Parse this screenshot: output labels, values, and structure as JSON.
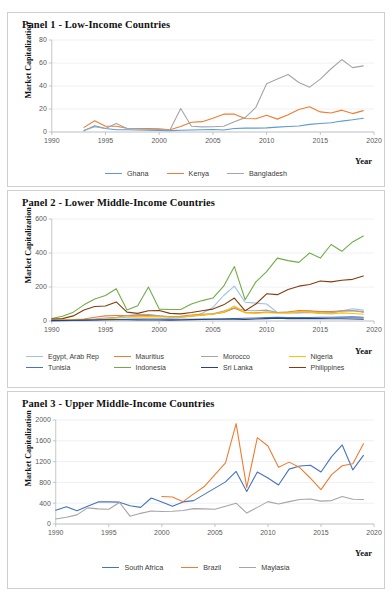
{
  "figure": {
    "ylabel": "Market Capitalization",
    "xlabel": "Year"
  },
  "panels": [
    {
      "id": "panel-1",
      "title": "Panel 1 - Low-Income Countries",
      "ylabel": "Market Capitalization",
      "xlabel": "Year",
      "yticks": [
        "0",
        "20",
        "40",
        "60",
        "80"
      ],
      "xticks": [
        "1990",
        "1995",
        "2000",
        "2005",
        "2010",
        "2015",
        "2020"
      ],
      "legend": [
        "Ghana",
        "Kenya",
        "Bangladesh"
      ]
    },
    {
      "id": "panel-2",
      "title": "Panel 2 - Lower Middle-Income Countries",
      "ylabel": "Market Capitalization",
      "xlabel": "Year",
      "yticks": [
        "0",
        "200",
        "400",
        "600"
      ],
      "xticks": [
        "1990",
        "1995",
        "2000",
        "2005",
        "2010",
        "2015",
        "2020"
      ],
      "legend": [
        "Egypt, Arab Rep",
        "Mauritius",
        "Morocco",
        "Nigeria",
        "Tunisia",
        "Indonesia",
        "Sri Lanka",
        "Philippines"
      ]
    },
    {
      "id": "panel-3",
      "title": "Panel 3 - Upper Middle-Income Countries",
      "ylabel": "Market Capitalization",
      "xlabel": "Year",
      "yticks": [
        "0",
        "400",
        "800",
        "1200",
        "1600",
        "2000"
      ],
      "xticks": [
        "1990",
        "1995",
        "2000",
        "2005",
        "2010",
        "2015",
        "2020"
      ],
      "legend": [
        "South Africa",
        "Brazil",
        "Maylasia"
      ]
    }
  ],
  "chart_data": [
    {
      "type": "line",
      "title": "Panel 1 - Low-Income Countries",
      "xlabel": "Year",
      "ylabel": "Market Capitalization",
      "xlim": [
        1990,
        2020
      ],
      "ylim": [
        0,
        80
      ],
      "yticks": [
        0,
        20,
        40,
        60,
        80
      ],
      "xticks": [
        1990,
        1995,
        2000,
        2005,
        2010,
        2015,
        2020
      ],
      "grid": true,
      "legend_position": "bottom",
      "series": [
        {
          "name": "Ghana",
          "color": "#5B9BD5",
          "x": [
            1993,
            1994,
            1995,
            1996,
            1997,
            1998,
            1999,
            2000,
            2001,
            2002,
            2003,
            2004,
            2005,
            2006,
            2007,
            2008,
            2009,
            2010,
            2011,
            2012,
            2013,
            2014,
            2015,
            2016,
            2017,
            2018,
            2019
          ],
          "values": [
            1.0,
            5.5,
            3.0,
            2.0,
            2.0,
            1.8,
            1.6,
            1.4,
            1.2,
            1.5,
            1.7,
            2.0,
            2.2,
            1.8,
            3.0,
            3.4,
            3.4,
            3.6,
            4.2,
            4.8,
            5.2,
            6.6,
            7.4,
            8.0,
            9.5,
            10.6,
            12.0
          ]
        },
        {
          "name": "Kenya",
          "color": "#ED7D31",
          "x": [
            1993,
            1994,
            1995,
            1996,
            1997,
            1998,
            1999,
            2000,
            2001,
            2002,
            2003,
            2004,
            2005,
            2006,
            2007,
            2008,
            2009,
            2010,
            2011,
            2012,
            2013,
            2014,
            2015,
            2016,
            2017,
            2018,
            2019
          ],
          "values": [
            4.0,
            9.8,
            5.0,
            5.0,
            3.2,
            3.0,
            3.0,
            2.8,
            1.9,
            4.8,
            8.5,
            9.0,
            12.0,
            15.5,
            15.5,
            11.8,
            11.5,
            14.5,
            11.2,
            15.0,
            19.5,
            22.0,
            17.5,
            16.5,
            19.0,
            16.0,
            18.6
          ]
        },
        {
          "name": "Bangladesh",
          "color": "#A5A5A5",
          "x": [
            1993,
            1994,
            1995,
            1996,
            1997,
            1998,
            1999,
            2000,
            2001,
            2002,
            2003,
            2004,
            2005,
            2006,
            2007,
            2008,
            2009,
            2010,
            2011,
            2012,
            2013,
            2014,
            2015,
            2016,
            2017,
            2018,
            2019
          ],
          "values": [
            1.5,
            4.5,
            3.0,
            7.5,
            3.0,
            2.6,
            2.4,
            2.2,
            1.8,
            20.5,
            5.0,
            4.5,
            4.6,
            5.0,
            9.0,
            12.5,
            21.5,
            42.0,
            46.0,
            50.0,
            43.0,
            39.0,
            46.0,
            55.0,
            63.0,
            56.0,
            57.5
          ]
        }
      ]
    },
    {
      "type": "line",
      "title": "Panel 2 - Lower Middle-Income Countries",
      "xlabel": "Year",
      "ylabel": "Market Capitalization",
      "xlim": [
        1990,
        2020
      ],
      "ylim": [
        0,
        600
      ],
      "yticks": [
        0,
        200,
        400,
        600
      ],
      "xticks": [
        1990,
        1995,
        2000,
        2005,
        2010,
        2015,
        2020
      ],
      "grid": true,
      "legend_position": "bottom",
      "series": [
        {
          "name": "Egypt, Arab Rep",
          "color": "#9DC3E6",
          "x": [
            1990,
            1991,
            1992,
            1993,
            1994,
            1995,
            1996,
            1997,
            1998,
            1999,
            2000,
            2001,
            2002,
            2003,
            2004,
            2005,
            2006,
            2007,
            2008,
            2009,
            2010,
            2011,
            2012,
            2013,
            2014,
            2015,
            2016,
            2017,
            2018,
            2019
          ],
          "values": [
            6,
            6,
            7,
            8,
            10,
            12,
            20,
            25,
            28,
            35,
            30,
            25,
            22,
            28,
            45,
            80,
            150,
            205,
            110,
            105,
            100,
            50,
            52,
            55,
            58,
            48,
            46,
            60,
            72,
            64
          ]
        },
        {
          "name": "Mauritius",
          "color": "#ED7D31",
          "x": [
            1990,
            1991,
            1992,
            1993,
            1994,
            1995,
            1996,
            1997,
            1998,
            1999,
            2000,
            2001,
            2002,
            2003,
            2004,
            2005,
            2006,
            2007,
            2008,
            2009,
            2010,
            2011,
            2012,
            2013,
            2014,
            2015,
            2016,
            2017,
            2018,
            2019
          ],
          "values": [
            5,
            6,
            8,
            12,
            22,
            30,
            32,
            32,
            30,
            32,
            28,
            26,
            28,
            35,
            40,
            42,
            50,
            75,
            50,
            48,
            52,
            50,
            52,
            62,
            60,
            55,
            55,
            60,
            62,
            52
          ]
        },
        {
          "name": "Morocco",
          "color": "#A5A5A5",
          "x": [
            1990,
            1991,
            1992,
            1993,
            1994,
            1995,
            1996,
            1997,
            1998,
            1999,
            2000,
            2001,
            2002,
            2003,
            2004,
            2005,
            2006,
            2007,
            2008,
            2009,
            2010,
            2011,
            2012,
            2013,
            2014,
            2015,
            2016,
            2017,
            2018,
            2019
          ],
          "values": [
            4,
            4,
            5,
            8,
            12,
            18,
            22,
            32,
            38,
            38,
            30,
            25,
            24,
            28,
            34,
            42,
            58,
            78,
            62,
            60,
            64,
            50,
            48,
            48,
            50,
            46,
            50,
            58,
            60,
            55
          ]
        },
        {
          "name": "Nigeria",
          "color": "#FFC000",
          "x": [
            1990,
            1991,
            1992,
            1993,
            1994,
            1995,
            1996,
            1997,
            1998,
            1999,
            2000,
            2001,
            2002,
            2003,
            2004,
            2005,
            2006,
            2007,
            2008,
            2009,
            2010,
            2011,
            2012,
            2013,
            2014,
            2015,
            2016,
            2017,
            2018,
            2019
          ],
          "values": [
            3,
            4,
            5,
            7,
            9,
            12,
            18,
            22,
            24,
            26,
            24,
            22,
            22,
            30,
            36,
            40,
            52,
            88,
            48,
            46,
            50,
            46,
            48,
            56,
            52,
            45,
            42,
            48,
            44,
            40
          ]
        },
        {
          "name": "Tunisia",
          "color": "#4472C4",
          "x": [
            1990,
            1991,
            1992,
            1993,
            1994,
            1995,
            1996,
            1997,
            1998,
            1999,
            2000,
            2001,
            2002,
            2003,
            2004,
            2005,
            2006,
            2007,
            2008,
            2009,
            2010,
            2011,
            2012,
            2013,
            2014,
            2015,
            2016,
            2017,
            2018,
            2019
          ],
          "values": [
            2,
            2,
            3,
            4,
            6,
            7,
            9,
            10,
            11,
            12,
            12,
            11,
            10,
            10,
            11,
            12,
            13,
            15,
            16,
            18,
            20,
            22,
            20,
            20,
            21,
            22,
            22,
            23,
            24,
            22
          ]
        },
        {
          "name": "Indonesia",
          "color": "#70AD47",
          "x": [
            1990,
            1991,
            1992,
            1993,
            1994,
            1995,
            1996,
            1997,
            1998,
            1999,
            2000,
            2001,
            2002,
            2003,
            2004,
            2005,
            2006,
            2007,
            2008,
            2009,
            2010,
            2011,
            2012,
            2013,
            2014,
            2015,
            2016,
            2017,
            2018,
            2019
          ],
          "values": [
            15,
            28,
            52,
            95,
            130,
            150,
            190,
            65,
            90,
            200,
            70,
            68,
            68,
            100,
            120,
            135,
            205,
            320,
            125,
            230,
            290,
            370,
            355,
            345,
            400,
            370,
            450,
            410,
            465,
            500,
            565,
            545,
            570
          ]
        },
        {
          "name": "Sri Lanka",
          "color": "#264478",
          "x": [
            1990,
            1991,
            1992,
            1993,
            1994,
            1995,
            1996,
            1997,
            1998,
            1999,
            2000,
            2001,
            2002,
            2003,
            2004,
            2005,
            2006,
            2007,
            2008,
            2009,
            2010,
            2011,
            2012,
            2013,
            2014,
            2015,
            2016,
            2017,
            2018,
            2019
          ],
          "values": [
            2,
            3,
            4,
            5,
            6,
            7,
            7,
            7,
            6,
            6,
            6,
            5,
            6,
            8,
            9,
            10,
            10,
            11,
            9,
            12,
            14,
            16,
            14,
            14,
            15,
            14,
            13,
            13,
            12,
            11
          ]
        },
        {
          "name": "Philippines",
          "color": "#843C0C",
          "x": [
            1990,
            1991,
            1992,
            1993,
            1994,
            1995,
            1996,
            1997,
            1998,
            1999,
            2000,
            2001,
            2002,
            2003,
            2004,
            2005,
            2006,
            2007,
            2008,
            2009,
            2010,
            2011,
            2012,
            2013,
            2014,
            2015,
            2016,
            2017,
            2018,
            2019
          ],
          "values": [
            12,
            14,
            30,
            65,
            85,
            88,
            112,
            52,
            45,
            60,
            62,
            45,
            42,
            50,
            60,
            70,
            95,
            135,
            60,
            100,
            160,
            155,
            185,
            205,
            215,
            235,
            230,
            240,
            245,
            265,
            290,
            275,
            270
          ]
        }
      ]
    },
    {
      "type": "line",
      "title": "Panel 3 - Upper Middle-Income Countries",
      "xlabel": "Year",
      "ylabel": "Market Capitalization",
      "xlim": [
        1990,
        2020
      ],
      "ylim": [
        0,
        2000
      ],
      "yticks": [
        0,
        400,
        800,
        1200,
        1600,
        2000
      ],
      "xticks": [
        1990,
        1995,
        2000,
        2005,
        2010,
        2015,
        2020
      ],
      "grid": true,
      "legend_position": "bottom",
      "series": [
        {
          "name": "South Africa",
          "color": "#4472C4",
          "x": [
            1990,
            1991,
            1992,
            1993,
            1994,
            1995,
            1996,
            1997,
            1998,
            1999,
            2000,
            2001,
            2002,
            2003,
            2004,
            2005,
            2006,
            2007,
            2008,
            2009,
            2010,
            2011,
            2012,
            2013,
            2014,
            2015,
            2016,
            2017,
            2018,
            2019
          ],
          "values": [
            265,
            330,
            255,
            340,
            425,
            425,
            420,
            350,
            320,
            500,
            425,
            340,
            425,
            450,
            570,
            690,
            810,
            1010,
            625,
            1000,
            885,
            750,
            1055,
            1115,
            1130,
            1000,
            1295,
            1520,
            1040,
            1320
          ]
        },
        {
          "name": "Brazil",
          "color": "#ED7D31",
          "x": [
            2000,
            2001,
            2002,
            2003,
            2004,
            2005,
            2006,
            2007,
            2008,
            2009,
            2010,
            2011,
            2012,
            2013,
            2014,
            2015,
            2016,
            2017,
            2018,
            2019
          ],
          "values": [
            530,
            520,
            430,
            580,
            720,
            950,
            1175,
            1930,
            700,
            1660,
            1500,
            1090,
            1190,
            1085,
            880,
            660,
            950,
            1120,
            1160,
            1545
          ]
        },
        {
          "name": "Maylasia",
          "color": "#A5A5A5",
          "x": [
            1990,
            1991,
            1992,
            1993,
            1994,
            1995,
            1996,
            1997,
            1998,
            1999,
            2000,
            2001,
            2002,
            2003,
            2004,
            2005,
            2006,
            2007,
            2008,
            2009,
            2010,
            2011,
            2012,
            2013,
            2014,
            2015,
            2016,
            2017,
            2018,
            2019
          ],
          "values": [
            95,
            130,
            175,
            310,
            290,
            285,
            415,
            150,
            205,
            250,
            240,
            245,
            260,
            295,
            290,
            285,
            340,
            400,
            210,
            320,
            430,
            385,
            430,
            470,
            480,
            440,
            450,
            530,
            475,
            470
          ]
        }
      ]
    }
  ]
}
